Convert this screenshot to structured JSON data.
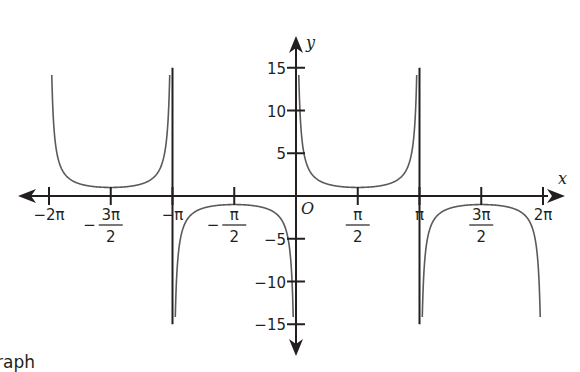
{
  "chart_data": {
    "type": "line",
    "title": "",
    "function": "y = cosec x",
    "xlabel": "x",
    "ylabel": "y",
    "origin_label": "O",
    "xlim": [
      -6.2832,
      6.2832
    ],
    "ylim": [
      -15,
      15
    ],
    "grid": false,
    "legend": null,
    "x_ticks": [
      {
        "value": -6.2832,
        "label": "−2π",
        "num": "",
        "den": "",
        "sign": ""
      },
      {
        "value": -4.7124,
        "label": "",
        "num": "3π",
        "den": "2",
        "sign": "−"
      },
      {
        "value": -3.1416,
        "label": "−π",
        "num": "",
        "den": "",
        "sign": ""
      },
      {
        "value": -1.5708,
        "label": "",
        "num": "π",
        "den": "2",
        "sign": "−"
      },
      {
        "value": 1.5708,
        "label": "",
        "num": "π",
        "den": "2",
        "sign": ""
      },
      {
        "value": 3.1416,
        "label": "π",
        "num": "",
        "den": "",
        "sign": ""
      },
      {
        "value": 4.7124,
        "label": "",
        "num": "3π",
        "den": "2",
        "sign": ""
      },
      {
        "value": 6.2832,
        "label": "2π",
        "num": "",
        "den": "",
        "sign": ""
      }
    ],
    "y_ticks": [
      {
        "value": 15,
        "label": "15"
      },
      {
        "value": 10,
        "label": "10"
      },
      {
        "value": 5,
        "label": "5"
      },
      {
        "value": -5,
        "label": "−5"
      },
      {
        "value": -10,
        "label": "−10"
      },
      {
        "value": -15,
        "label": "−15"
      }
    ],
    "asymptotes_x": [
      -3.1416,
      3.1416
    ],
    "series": [
      {
        "name": "branch (−2π, −π)",
        "x_range": [
          -6.2832,
          -3.1416
        ],
        "sign": 1,
        "min_point": [
          -4.7124,
          1
        ]
      },
      {
        "name": "branch (−π, 0)",
        "x_range": [
          -3.1416,
          0
        ],
        "sign": -1,
        "max_point": [
          -1.5708,
          -1
        ]
      },
      {
        "name": "branch (0, π)",
        "x_range": [
          0,
          3.1416
        ],
        "sign": 1,
        "min_point": [
          1.5708,
          1
        ]
      },
      {
        "name": "branch (π, 2π)",
        "x_range": [
          3.1416,
          6.2832
        ],
        "sign": -1,
        "max_point": [
          4.7124,
          -1
        ]
      }
    ],
    "style": {
      "line_color": "#5a5a5a",
      "axis_color": "#231f20"
    }
  },
  "caption": "raph"
}
